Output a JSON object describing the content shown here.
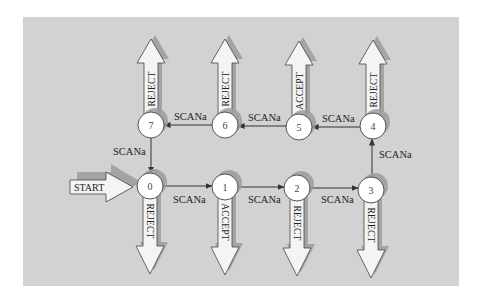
{
  "diagram": {
    "type": "finite-state-machine",
    "colors": {
      "background": "#ffffff",
      "panel": "#d2d2d2",
      "shadow": "#9c9c9c",
      "node_fill": "#ffffff",
      "arrow_fill": "#f4f4f4",
      "stroke": "#333333"
    },
    "start": {
      "label": "START",
      "target": "0"
    },
    "nodes": [
      {
        "id": "0",
        "label": "0",
        "outcome": "REJECT",
        "direction": "down"
      },
      {
        "id": "1",
        "label": "1",
        "outcome": "ACCEPT",
        "direction": "down"
      },
      {
        "id": "2",
        "label": "2",
        "outcome": "REJECT",
        "direction": "down"
      },
      {
        "id": "3",
        "label": "3",
        "outcome": "REJECT",
        "direction": "down"
      },
      {
        "id": "4",
        "label": "4",
        "outcome": "REJECT",
        "direction": "up"
      },
      {
        "id": "5",
        "label": "5",
        "outcome": "ACCEPT",
        "direction": "up"
      },
      {
        "id": "6",
        "label": "6",
        "outcome": "REJECT",
        "direction": "up"
      },
      {
        "id": "7",
        "label": "7",
        "outcome": "REJECT",
        "direction": "up"
      }
    ],
    "edges": [
      {
        "from": "0",
        "to": "1",
        "label": "SCANa"
      },
      {
        "from": "1",
        "to": "2",
        "label": "SCANa"
      },
      {
        "from": "2",
        "to": "3",
        "label": "SCANa"
      },
      {
        "from": "3",
        "to": "4",
        "label": "SCANa"
      },
      {
        "from": "4",
        "to": "5",
        "label": "SCANa"
      },
      {
        "from": "5",
        "to": "6",
        "label": "SCANa"
      },
      {
        "from": "6",
        "to": "7",
        "label": "SCANa"
      },
      {
        "from": "7",
        "to": "0",
        "label": "SCANa"
      }
    ]
  }
}
